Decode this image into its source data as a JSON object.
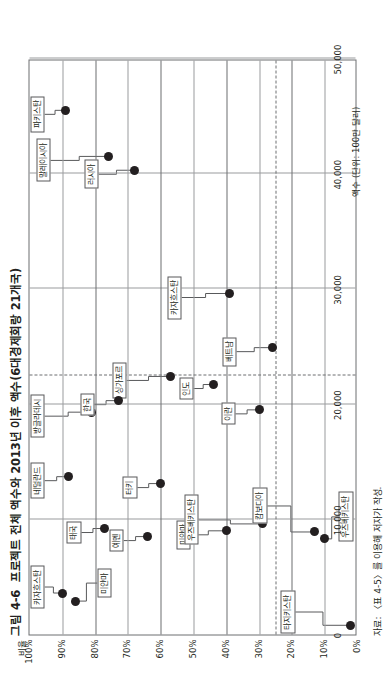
{
  "figure": {
    "number": "그림 4-6",
    "title": "프로젝트 전체 액수와 2013년 이후 액수(6대경제회랑 21개국)",
    "source": "자료: 〈표 4-5〉를 이용해 저자가 작성."
  },
  "chart_data": {
    "type": "scatter",
    "xlabel": "액수 (단위: 100만 달러)",
    "ylabel": "비율",
    "xlim": [
      0,
      50000
    ],
    "ylim": [
      0,
      100
    ],
    "xticks": [
      "0",
      "10,000",
      "20,000",
      "30,000",
      "40,000",
      "50,000"
    ],
    "xtick_values": [
      0,
      10000,
      20000,
      30000,
      40000,
      50000
    ],
    "yticks": [
      "0%",
      "10%",
      "20%",
      "30%",
      "40%",
      "50%",
      "60%",
      "70%",
      "80%",
      "90%",
      "100%"
    ],
    "ytick_values": [
      0,
      10,
      20,
      30,
      40,
      50,
      60,
      70,
      80,
      90,
      100
    ],
    "grid": true,
    "reference_lines": [
      {
        "axis": "x",
        "value": 22500,
        "style": "dashed"
      },
      {
        "axis": "y",
        "value": 25,
        "style": "dashed"
      }
    ],
    "legend": "none",
    "points": [
      {
        "label": "파키스탄",
        "x": 45500,
        "y": 89
      },
      {
        "label": "말레이시아",
        "x": 41500,
        "y": 76
      },
      {
        "label": "러시아",
        "x": 40300,
        "y": 68
      },
      {
        "label": "카자흐스탄",
        "x": 29600,
        "y": 39
      },
      {
        "label": "싱가포르",
        "x": 22400,
        "y": 57
      },
      {
        "label": "인도",
        "x": 21700,
        "y": 44
      },
      {
        "label": "베트남",
        "x": 24900,
        "y": 26
      },
      {
        "label": "방글라데시",
        "x": 19300,
        "y": 81
      },
      {
        "label": "한국",
        "x": 20300,
        "y": 73
      },
      {
        "label": "이란",
        "x": 19500,
        "y": 30
      },
      {
        "label": "네덜란드",
        "x": 13700,
        "y": 88
      },
      {
        "label": "터키",
        "x": 13100,
        "y": 60
      },
      {
        "label": "태국",
        "x": 9200,
        "y": 77
      },
      {
        "label": "예멘",
        "x": 8500,
        "y": 64
      },
      {
        "label": "미얀마",
        "x": 9000,
        "y": 40
      },
      {
        "label": "우즈베키스탄",
        "x": 9600,
        "y": 29
      },
      {
        "label": "캄보디아",
        "x": 8900,
        "y": 13
      },
      {
        "label": "우즈베키스탄",
        "x": 8300,
        "y": 10
      },
      {
        "label": "카자흐스탄",
        "x": 3600,
        "y": 90
      },
      {
        "label": "미얀마",
        "x": 2900,
        "y": 86
      },
      {
        "label": "타지키스탄",
        "x": 800,
        "y": 2
      }
    ]
  },
  "callouts": [
    {
      "label": "파키스탄"
    },
    {
      "label": "말레이시아"
    },
    {
      "label": "러시아"
    },
    {
      "label": "카자흐스탄"
    },
    {
      "label": "싱가포르"
    },
    {
      "label": "인도"
    },
    {
      "label": "베트남"
    },
    {
      "label": "방글라데시"
    },
    {
      "label": "한국"
    },
    {
      "label": "이란"
    },
    {
      "label": "네덜란드"
    },
    {
      "label": "터키"
    },
    {
      "label": "태국"
    },
    {
      "label": "예멘"
    },
    {
      "label": "미얀마"
    },
    {
      "label": "우즈베키스탄"
    },
    {
      "label": "캄보디아"
    },
    {
      "label": "우즈베키스탄"
    },
    {
      "label": "카자흐스탄"
    },
    {
      "label": "미얀마"
    },
    {
      "label": "타지키스탄"
    }
  ]
}
